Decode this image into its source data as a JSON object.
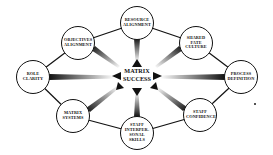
{
  "diagram": {
    "center": {
      "label": "MATRIX\nSUCCESS",
      "x": 137,
      "y": 77
    },
    "nodes": [
      {
        "id": "resource-alignment",
        "label": "RESOURCE\nALIGNMENT",
        "x": 137,
        "y": 23
      },
      {
        "id": "objectives-alignment",
        "label": "OBJECTIVES\nALIGNMENT",
        "x": 78,
        "y": 43
      },
      {
        "id": "shared-fate-culture",
        "label": "SHARED\nFATE\nCULTURE",
        "x": 196,
        "y": 43
      },
      {
        "id": "role-clarity",
        "label": "ROLE\nCLARITY",
        "x": 33,
        "y": 77
      },
      {
        "id": "process-definition",
        "label": "PROCESS\nDEFINITION",
        "x": 241,
        "y": 77
      },
      {
        "id": "matrix-systems",
        "label": "MATRIX\nSYSTEMS",
        "x": 73,
        "y": 116
      },
      {
        "id": "staff-confidence",
        "label": "STAFF\nCONFIDENCE",
        "x": 200,
        "y": 115
      },
      {
        "id": "staff-interpersonal-skills",
        "label": "STAFF\nINTERPER-\nSONAL\nSKILLS",
        "x": 137,
        "y": 133
      }
    ],
    "ring_order": [
      "resource-alignment",
      "shared-fate-culture",
      "process-definition",
      "staff-confidence",
      "staff-interpersonal-skills",
      "matrix-systems",
      "role-clarity",
      "objectives-alignment"
    ],
    "colors": {
      "stroke": "#111111",
      "ray_start": "#111111",
      "ray_end": "#ffffff",
      "background": "#ffffff"
    }
  }
}
